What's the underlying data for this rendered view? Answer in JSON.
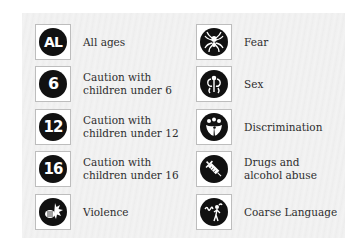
{
  "colors": {
    "panel_bg": "#f0f0f0",
    "icon_disc": "#111111",
    "icon_border": "#bdbdbd",
    "text": "#2e2e2e"
  },
  "legend": {
    "left": [
      {
        "icon": "all-ages-icon",
        "glyph": "AL",
        "label": "All ages"
      },
      {
        "icon": "rating-6-icon",
        "glyph": "6",
        "label": "Caution with\nchildren under 6"
      },
      {
        "icon": "rating-12-icon",
        "glyph": "12",
        "label": "Caution with\nchildren under 12"
      },
      {
        "icon": "rating-16-icon",
        "glyph": "16",
        "label": "Caution with\nchildren under 16"
      },
      {
        "icon": "violence-icon",
        "glyph": "",
        "label": "Violence"
      }
    ],
    "right": [
      {
        "icon": "fear-spider-icon",
        "glyph": "",
        "label": "Fear"
      },
      {
        "icon": "sex-icon",
        "glyph": "",
        "label": "Sex"
      },
      {
        "icon": "discrimination-icon",
        "glyph": "",
        "label": "Discrimination"
      },
      {
        "icon": "drugs-syringe-icon",
        "glyph": "",
        "label": "Drugs and\nalcohol abuse"
      },
      {
        "icon": "coarse-language-icon",
        "glyph": "",
        "label": "Coarse Language"
      }
    ]
  }
}
